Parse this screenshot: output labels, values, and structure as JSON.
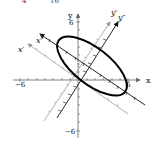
{
  "figure": {
    "top_fragment": {
      "left": "4",
      "right": "16"
    },
    "axes": {
      "x_label": "x",
      "y_label": "y",
      "x_min_label": "−6",
      "x_max_label": "6",
      "y_max_label": "6",
      "y_min_label": "−6"
    },
    "rotated_axes": {
      "x_prime_label": "x′",
      "y_prime_label": "y′",
      "x_double_prime_label": "x″",
      "y_double_prime_label": "y″"
    },
    "curve": {
      "type": "ellipse",
      "rotation_deg": 38
    },
    "colors": {
      "axis": "#555555",
      "primed_axis": "#888888",
      "double_primed_axis": "#111111",
      "ellipse": "#000000"
    }
  }
}
